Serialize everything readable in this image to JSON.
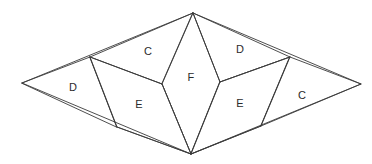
{
  "diagram": {
    "background_color": "#ffffff",
    "stroke_color": "#3a3a3a",
    "label_color": "#2b2b2b",
    "vertices": {
      "top": [
        193,
        13
      ],
      "bottom": [
        191,
        154
      ],
      "left": [
        22,
        83
      ],
      "right": [
        361,
        84
      ],
      "inner_left_upper": [
        90,
        57
      ],
      "inner_left_lower": [
        117,
        127
      ],
      "inner_right_upper": [
        290,
        57
      ],
      "inner_right_lower": [
        261,
        126
      ],
      "kite_left": [
        162,
        84
      ],
      "kite_right": [
        220,
        82
      ]
    },
    "faces": [
      {
        "name": "face-c-top-left",
        "label": "C",
        "label_pos": [
          148,
          52
        ],
        "points": "90,57 193,13 220,82 162,84"
      },
      {
        "name": "face-d-top-right",
        "label": "D",
        "label_pos": [
          240,
          50
        ],
        "points": "193,13 290,57 220,82"
      },
      {
        "name": "face-d-left",
        "label": "D",
        "label_pos": [
          73,
          88
        ],
        "points": "22,83 90,57 117,127"
      },
      {
        "name": "face-f-center",
        "label": "F",
        "label_pos": [
          191,
          78
        ],
        "points": "193,13 220,82 191,154 162,84"
      },
      {
        "name": "face-e-lower-left",
        "label": "E",
        "label_pos": [
          139,
          105
        ],
        "points": "90,57 162,84 191,154 117,127"
      },
      {
        "name": "face-e-lower-right",
        "label": "E",
        "label_pos": [
          240,
          104
        ],
        "points": "220,82 290,57 261,126 191,154"
      },
      {
        "name": "face-c-right",
        "label": "C",
        "label_pos": [
          302,
          96
        ],
        "points": "290,57 361,84 261,126"
      }
    ],
    "edges": [
      {
        "name": "outline-top-left",
        "from": [
          22,
          83
        ],
        "to": [
          193,
          13
        ]
      },
      {
        "name": "outline-top-right",
        "from": [
          193,
          13
        ],
        "to": [
          361,
          84
        ]
      },
      {
        "name": "outline-bottom-right",
        "from": [
          361,
          84
        ],
        "to": [
          191,
          154
        ]
      },
      {
        "name": "outline-bottom-left",
        "from": [
          191,
          154
        ],
        "to": [
          22,
          83
        ]
      },
      {
        "name": "cut-left-upper",
        "from": [
          90,
          57
        ],
        "to": [
          162,
          84
        ]
      },
      {
        "name": "cut-left-vertical",
        "from": [
          90,
          57
        ],
        "to": [
          117,
          127
        ]
      },
      {
        "name": "cut-left-lower",
        "from": [
          117,
          127
        ],
        "to": [
          191,
          154
        ]
      },
      {
        "name": "cut-kite-left-top",
        "from": [
          193,
          13
        ],
        "to": [
          162,
          84
        ]
      },
      {
        "name": "cut-kite-left-bottom",
        "from": [
          162,
          84
        ],
        "to": [
          191,
          154
        ]
      },
      {
        "name": "cut-kite-right-top",
        "from": [
          193,
          13
        ],
        "to": [
          220,
          82
        ]
      },
      {
        "name": "cut-kite-right-bottom",
        "from": [
          220,
          82
        ],
        "to": [
          191,
          154
        ]
      },
      {
        "name": "cut-right-upper",
        "from": [
          220,
          82
        ],
        "to": [
          290,
          57
        ]
      },
      {
        "name": "cut-right-vertical",
        "from": [
          290,
          57
        ],
        "to": [
          261,
          126
        ]
      },
      {
        "name": "cut-right-lower",
        "from": [
          261,
          126
        ],
        "to": [
          191,
          154
        ]
      }
    ]
  }
}
